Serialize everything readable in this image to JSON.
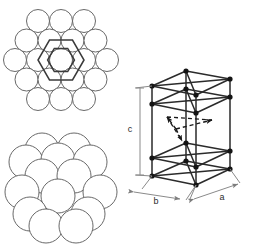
{
  "figure": {
    "name": "hexagonal-close-packed-structure",
    "background_color": "#ffffff",
    "width": 253,
    "height": 247
  },
  "style": {
    "sphere_outline_color": "#585858",
    "sphere_fill_color": "#ffffff",
    "hexagon_color": "#3a3a3a",
    "cell_edge_color": "#2b2b2b",
    "cell_vertex_color": "#141414",
    "dashed_arrow_color": "#1a1a1a",
    "dimension_line_color": "#8a8a8a",
    "label_color": "#2b2b2b"
  },
  "panels": {
    "top_left": {
      "name": "close-packed-layer-top-view",
      "description": "Top view of a close-packed layer of spheres with hexagon outlines",
      "rows": [
        3,
        4,
        5,
        4,
        3
      ],
      "sphere_count": 19,
      "sphere_radius": 11.5,
      "row_spacing": 19.9,
      "column_spacing": 23,
      "center_x": 61,
      "center_y": 60,
      "overlays": [
        {
          "name": "outer-hexagon",
          "radius": 23,
          "rotation": 0
        },
        {
          "name": "inner-hexagon",
          "radius": 15.5,
          "rotation": 30
        }
      ]
    },
    "bottom_left": {
      "name": "close-packed-stack-perspective",
      "description": "Perspective view of stacked close-packed sphere layers",
      "sphere_radius": 17,
      "center_x": 61,
      "center_y": 189,
      "layers": [
        {
          "name": "back-layer",
          "dy": -30,
          "dx": 0,
          "offsets": [
            -30,
            0,
            30
          ]
        },
        {
          "name": "upper-ring",
          "dy": -14,
          "dx": 0,
          "offsets": [
            -30,
            0,
            30
          ]
        },
        {
          "name": "middle-layer",
          "dy": 6,
          "dx": 0,
          "offsets": [
            -30,
            0,
            30
          ]
        },
        {
          "name": "front-layer",
          "dy": 28,
          "dx": 0,
          "offsets": [
            -30,
            0,
            30
          ]
        }
      ]
    },
    "right": {
      "name": "hcp-unit-cell",
      "description": "Hexagonal close-packed unit cell with lattice parameters",
      "labels": {
        "a": "a",
        "b": "b",
        "c": "c"
      },
      "label_positions": {
        "a": {
          "x": 222,
          "y": 199
        },
        "b": {
          "x": 155,
          "y": 201
        },
        "c": {
          "x": 130,
          "y": 129
        }
      },
      "interior_arrows": 3,
      "interior_arrow_style": "dashed",
      "vertex_count": 12,
      "cell_type": "orthorhombic-representation"
    }
  }
}
